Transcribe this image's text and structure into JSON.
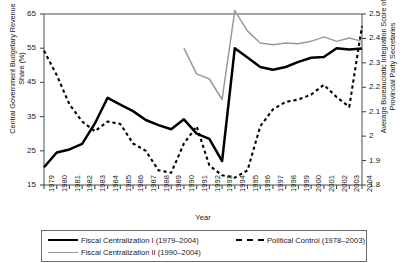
{
  "axes": {
    "left_title": "Central Government Budgetary Revenue Share (%)",
    "right_title": "Average Bureaucratic Integration Score of Provincial Party Secretaries",
    "x_title": "Year"
  },
  "legend": {
    "items": [
      {
        "name": "fiscal-centralization-1",
        "label": "Fiscal Centralization I (1979–2004)",
        "style": "solid-black"
      },
      {
        "name": "political-control",
        "label": "Political Control (1978–2003)",
        "style": "dashed-black"
      },
      {
        "name": "fiscal-centralization-2",
        "label": "Fiscal Centralization II (1990–2004)",
        "style": "solid-gray"
      }
    ]
  },
  "chart_data": {
    "type": "line",
    "title": "",
    "xlabel": "Year",
    "ylabel": "Central Government Budgetary Revenue Share (%)",
    "y2label": "Average Bureaucratic Integration Score of Provincial Party Secretaries",
    "grid": false,
    "legend_position": "bottom",
    "x": [
      1979,
      1980,
      1981,
      1982,
      1983,
      1984,
      1985,
      1986,
      1987,
      1988,
      1989,
      1990,
      1991,
      1992,
      1993,
      1994,
      1995,
      1996,
      1997,
      1998,
      1999,
      2000,
      2001,
      2002,
      2003,
      2004
    ],
    "xlim": [
      1979,
      2004
    ],
    "ylim": [
      15,
      65
    ],
    "yticks": [
      15,
      25,
      35,
      45,
      55,
      65
    ],
    "y2lim": [
      1.8,
      2.5
    ],
    "y2ticks": [
      1.8,
      1.9,
      2.0,
      2.1,
      2.2,
      2.3,
      2.4,
      2.5
    ],
    "y2ticklabels": [
      "1.8",
      "1.9",
      "2",
      "2.1",
      "2.2",
      "2.3",
      "2.4",
      "2.5"
    ],
    "series": [
      {
        "name": "Fiscal Centralization I (1979–2004)",
        "axis": "left",
        "style": "solid-black",
        "color": "#000000",
        "x": [
          1979,
          1980,
          1981,
          1982,
          1983,
          1984,
          1985,
          1986,
          1987,
          1988,
          1989,
          1990,
          1991,
          1992,
          1993,
          1994,
          1995,
          1996,
          1997,
          1998,
          1999,
          2000,
          2001,
          2002,
          2003,
          2004
        ],
        "values": [
          20.2,
          24.5,
          25.4,
          27.0,
          33.0,
          40.5,
          38.5,
          36.6,
          34.0,
          32.5,
          31.3,
          34.2,
          30.0,
          28.5,
          22.0,
          55.0,
          52.3,
          49.5,
          48.7,
          49.5,
          51.0,
          52.2,
          52.4,
          55.0,
          54.6,
          54.9
        ]
      },
      {
        "name": "Fiscal Centralization II (1990–2004)",
        "axis": "left",
        "style": "solid-gray",
        "color": "#9a9a9a",
        "x": [
          1990,
          1991,
          1992,
          1993,
          1994,
          1995,
          1996,
          1997,
          1998,
          1999,
          2000,
          2001,
          2002,
          2003,
          2004
        ],
        "values": [
          55.0,
          47.5,
          46.0,
          40.0,
          66.0,
          60.0,
          56.5,
          56.0,
          56.5,
          56.3,
          57.0,
          58.3,
          57.0,
          58.0,
          57.0
        ]
      },
      {
        "name": "Political Control (1978–2003)",
        "axis": "right",
        "style": "dashed-black",
        "color": "#000000",
        "x": [
          1979,
          1980,
          1981,
          1982,
          1983,
          1984,
          1985,
          1986,
          1987,
          1988,
          1989,
          1990,
          1991,
          1992,
          1993,
          1994,
          1995,
          1996,
          1997,
          1998,
          1999,
          2000,
          2001,
          2002,
          2003,
          2004
        ],
        "values": [
          2.35,
          2.25,
          2.13,
          2.06,
          2.02,
          2.06,
          2.05,
          1.97,
          1.94,
          1.86,
          1.85,
          1.97,
          2.04,
          1.88,
          1.84,
          1.83,
          1.86,
          2.04,
          2.11,
          2.14,
          2.15,
          2.17,
          2.21,
          2.16,
          2.12,
          2.45
        ]
      }
    ]
  }
}
